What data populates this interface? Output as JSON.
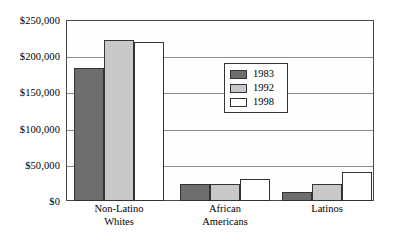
{
  "chart_data": {
    "type": "bar",
    "title": "",
    "subtitle": "",
    "xlabel": "",
    "ylabel": "",
    "categories": [
      "Non-Latino Whites",
      "African Americans",
      "Latinos"
    ],
    "category_lines": [
      [
        "Non-Latino",
        "Whites"
      ],
      [
        "African",
        "Americans"
      ],
      [
        "Latinos"
      ]
    ],
    "series": [
      {
        "name": "1983",
        "color": "#6e6e6e",
        "values": [
          184000,
          24000,
          12000
        ]
      },
      {
        "name": "1992",
        "color": "#c8c8c8",
        "values": [
          223000,
          24000,
          23000
        ]
      },
      {
        "name": "1998",
        "color": "#ffffff",
        "values": [
          219000,
          30000,
          40000
        ]
      }
    ],
    "ylim": [
      0,
      250000
    ],
    "ytick_values": [
      0,
      50000,
      100000,
      150000,
      200000,
      250000
    ],
    "ytick_labels": [
      "$0",
      "$50,000",
      "$100,000",
      "$150,000",
      "$200,000",
      "$250,000"
    ],
    "grid": true,
    "grid_axis": "y",
    "legend": {
      "position": "inside-upper-center",
      "entries": [
        {
          "label": "1983",
          "color": "#6e6e6e"
        },
        {
          "label": "1992",
          "color": "#c8c8c8"
        },
        {
          "label": "1998",
          "color": "#ffffff"
        }
      ]
    },
    "colors": {
      "axis": "#4a4a4a",
      "gridline": "#8a8a8a",
      "bar_outline": "#333333",
      "background": "#ffffff",
      "text": "#000000"
    }
  }
}
